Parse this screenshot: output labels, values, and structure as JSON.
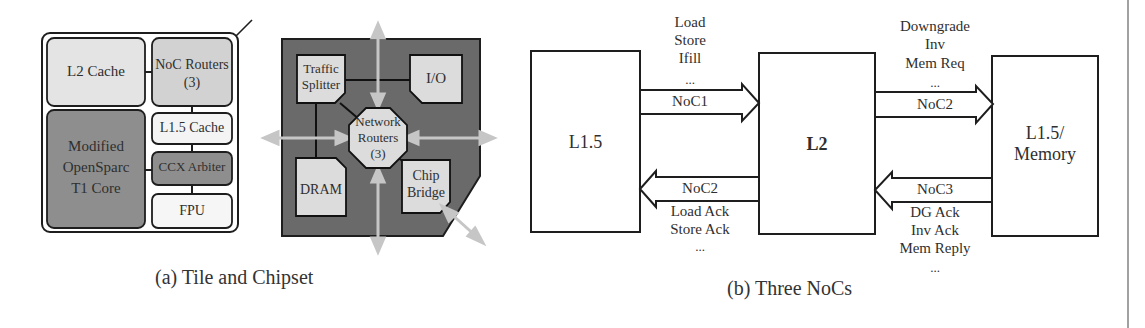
{
  "figure_a": {
    "caption": "(a) Tile and Chipset",
    "tile": {
      "l2_cache": "L2 Cache",
      "noc_routers_line1": "NoC Routers",
      "noc_routers_line2": "(3)",
      "core_line1": "Modified",
      "core_line2": "OpenSparc",
      "core_line3": "T1 Core",
      "l15_cache": "L1.5 Cache",
      "ccx_arbiter": "CCX Arbiter",
      "fpu": "FPU"
    },
    "chipset": {
      "traffic_splitter_line1": "Traffic",
      "traffic_splitter_line2": "Splitter",
      "io": "I/O",
      "network_routers_line1": "Network",
      "network_routers_line2": "Routers",
      "network_routers_line3": "(3)",
      "dram": "DRAM",
      "chip_bridge_line1": "Chip",
      "chip_bridge_line2": "Bridge"
    },
    "colors": {
      "light_block": "#e4e4e4",
      "mid_block": "#d0d0d0",
      "dark_block": "#8e8e8e",
      "white_block": "#f6f6f6",
      "chipset_bg": "#6a6a6a",
      "arrow": "#c8c8c8"
    }
  },
  "figure_b": {
    "caption": "(b) Three NoCs",
    "boxes": {
      "left": "L1.5",
      "middle": "L2",
      "right_line1": "L1.5/",
      "right_line2": "Memory"
    },
    "arrows": {
      "noc1": {
        "label": "NoC1",
        "messages": [
          "Load",
          "Store",
          "Ifill",
          "..."
        ]
      },
      "noc2_left": {
        "label": "NoC2",
        "messages": [
          "Load Ack",
          "Store Ack",
          "..."
        ]
      },
      "noc2_right": {
        "label": "NoC2",
        "messages": [
          "Downgrade",
          "Inv",
          "Mem Req",
          "..."
        ]
      },
      "noc3": {
        "label": "NoC3",
        "messages": [
          "DG Ack",
          "Inv Ack",
          "Mem Reply",
          "..."
        ]
      }
    }
  }
}
